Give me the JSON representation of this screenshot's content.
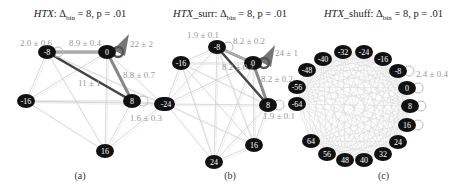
{
  "figure": {
    "panels": [
      {
        "id": "a",
        "title_prefix": "HTX",
        "title_suffix": ": Δ",
        "title_sub": "bin",
        "title_rest": " = 8, p = .01",
        "caption": "(a)",
        "nodes": [
          {
            "label": "-8",
            "x": 47,
            "y": 52
          },
          {
            "label": "0",
            "x": 107,
            "y": 52
          },
          {
            "label": "-16",
            "x": 26,
            "y": 101
          },
          {
            "label": "8",
            "x": 132,
            "y": 101
          },
          {
            "label": "-24",
            "x": 163,
            "y": 104
          },
          {
            "label": "16",
            "x": 105,
            "y": 151
          }
        ],
        "edge_labels": [
          {
            "text": "2.0 ± 0.6",
            "x": 20,
            "y": 46
          },
          {
            "text": "8.9 ± 0.4",
            "x": 69,
            "y": 46
          },
          {
            "text": "22 ± 2",
            "x": 130,
            "y": 47
          },
          {
            "text": "8.8 ± 0.7",
            "x": 123,
            "y": 78
          },
          {
            "text": "11 ± 1",
            "x": 78,
            "y": 86
          },
          {
            "text": "1.6 ± 0.3",
            "x": 130,
            "y": 121
          }
        ]
      },
      {
        "id": "b",
        "title_prefix": "HTX",
        "title_suffix": "_surr: Δ",
        "title_sub": "bin",
        "title_rest": " = 8, p = .01",
        "caption": "(b)",
        "nodes": [
          {
            "label": "-8",
            "x": 217,
            "y": 47
          },
          {
            "label": "-16",
            "x": 181,
            "y": 63
          },
          {
            "label": "0",
            "x": 253,
            "y": 63
          },
          {
            "label": "-24",
            "x": 166,
            "y": 104
          },
          {
            "label": "8",
            "x": 268,
            "y": 105
          },
          {
            "label": "16",
            "x": 254,
            "y": 145
          },
          {
            "label": "24",
            "x": 214,
            "y": 162
          }
        ],
        "edge_labels": [
          {
            "text": "1.9 ± 0.1",
            "x": 187,
            "y": 38
          },
          {
            "text": "8.2 ± 0.2",
            "x": 233,
            "y": 44
          },
          {
            "text": "24 ± 1",
            "x": 275,
            "y": 56
          },
          {
            "text": "8.2 ± 0.2",
            "x": 261,
            "y": 82
          },
          {
            "text": "8.2 ± 0.2",
            "x": 222,
            "y": 70
          },
          {
            "text": "1.9 ± 0.1",
            "x": 263,
            "y": 119
          }
        ]
      },
      {
        "id": "c",
        "title_prefix": "HTX",
        "title_suffix": "_shuff: Δ",
        "title_sub": "bin",
        "title_rest": " = 8, p = .01",
        "caption": "(c)",
        "nodes": [
          {
            "label": "-32",
            "x": 343,
            "y": 52
          },
          {
            "label": "-24",
            "x": 364,
            "y": 52
          },
          {
            "label": "-40",
            "x": 323,
            "y": 59
          },
          {
            "label": "-16",
            "x": 383,
            "y": 59
          },
          {
            "label": "-48",
            "x": 307,
            "y": 70
          },
          {
            "label": "-8",
            "x": 398,
            "y": 71
          },
          {
            "label": "-56",
            "x": 297,
            "y": 87
          },
          {
            "label": "0",
            "x": 407,
            "y": 88
          },
          {
            "label": "-64",
            "x": 297,
            "y": 104
          },
          {
            "label": "8",
            "x": 410,
            "y": 106
          },
          {
            "label": "64",
            "x": 311,
            "y": 141
          },
          {
            "label": "16",
            "x": 407,
            "y": 125
          },
          {
            "label": "56",
            "x": 327,
            "y": 154
          },
          {
            "label": "24",
            "x": 398,
            "y": 142
          },
          {
            "label": "48",
            "x": 345,
            "y": 160
          },
          {
            "label": "32",
            "x": 383,
            "y": 154
          },
          {
            "label": "40",
            "x": 364,
            "y": 160
          }
        ],
        "edge_labels": [
          {
            "text": "2.4 ± 0.4",
            "x": 416,
            "y": 77
          }
        ]
      }
    ],
    "colors": {
      "node_fill": "#111111",
      "edge_strong": "#444444",
      "edge_mid": "#888888",
      "edge_light": "#cfcfcf",
      "label_gray": "#999999"
    }
  }
}
